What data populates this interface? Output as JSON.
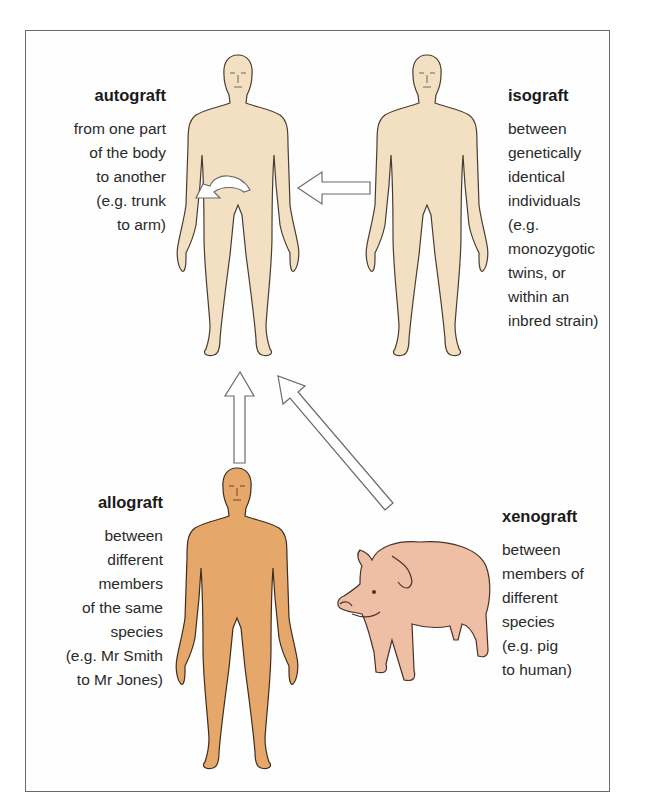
{
  "diagram": {
    "colors": {
      "skin_light": "#f3e0c3",
      "skin_dark": "#e5a76a",
      "pig": "#eebfa5",
      "outline": "#4a3b30",
      "arrow_fill": "#ffffff",
      "arrow_stroke": "#6a6a6a",
      "frame": "#6a6a6a"
    },
    "nodes": [
      {
        "id": "autograft",
        "title": "autograft",
        "description": "from one part\nof the body\nto another\n(e.g. trunk\nto arm)",
        "figure": "human-light",
        "position": "top-left"
      },
      {
        "id": "isograft",
        "title": "isograft",
        "description": "between\ngenetically\nidentical\nindividuals\n(e.g.\nmonozygotic\ntwins, or\nwithin an\ninbred strain)",
        "figure": "human-light",
        "position": "top-right"
      },
      {
        "id": "allograft",
        "title": "allograft",
        "description": "between\ndifferent\nmembers\nof the same\nspecies\n(e.g. Mr Smith\nto Mr Jones)",
        "figure": "human-dark",
        "position": "bottom-left"
      },
      {
        "id": "xenograft",
        "title": "xenograft",
        "description": "between\nmembers of\ndifferent\nspecies\n(e.g. pig\nto human)",
        "figure": "pig",
        "position": "bottom-right"
      }
    ],
    "edges": [
      {
        "from": "isograft",
        "to": "autograft",
        "style": "hollow-arrow-left"
      },
      {
        "from": "allograft",
        "to": "autograft",
        "style": "hollow-arrow-up"
      },
      {
        "from": "xenograft",
        "to": "autograft",
        "style": "hollow-arrow-diagonal"
      },
      {
        "from": "autograft-trunk",
        "to": "autograft-arm",
        "style": "curved-hollow-arrow"
      }
    ]
  }
}
